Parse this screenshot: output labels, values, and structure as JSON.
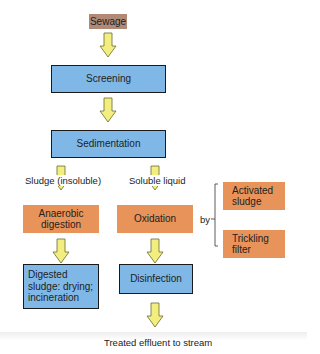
{
  "diagram": {
    "nodes": {
      "sewage": "Sewage",
      "screening": "Screening",
      "sedimentation": "Sedimentation",
      "anaerobic": "Anaerobic digestion",
      "oxidation": "Oxidation",
      "activated": "Activated sludge",
      "trickling": "Trickling filter",
      "digested": "Digested sludge: drying; incineration",
      "disinfection": "Disinfection"
    },
    "labels": {
      "sludge": "Sludge (insoluble)",
      "liquid": "Soluble liquid",
      "by": "by",
      "effluent": "Treated effluent to stream"
    },
    "colors": {
      "process": "#7fb8e6",
      "treatment": "#e8935a",
      "input": "#b08a77",
      "arrow": "#f2ee80"
    }
  }
}
